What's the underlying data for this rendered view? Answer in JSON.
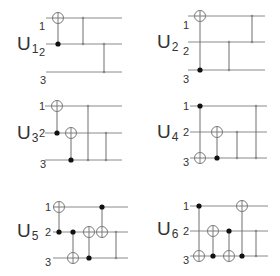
{
  "diagram": {
    "width": 280,
    "height": 276,
    "colors": {
      "wire": "#8a8a8a",
      "control": "#111111",
      "target": "#7a7a7a",
      "text": "#333333"
    },
    "panels": [
      {
        "name": "U1",
        "letter": "U",
        "subscript": "1",
        "label_pos": [
          17,
          50
        ],
        "wire_x": [
          46,
          122
        ],
        "wires_y": [
          18,
          44,
          72
        ],
        "qubit_labels": [
          {
            "text": "1",
            "x": 39,
            "y": 30
          },
          {
            "text": "2",
            "x": 39,
            "y": 56
          },
          {
            "text": "3",
            "x": 40,
            "y": 84
          }
        ],
        "gates": [
          {
            "type": "cnot",
            "x": 58,
            "control": 2,
            "target": 1
          },
          {
            "type": "cz",
            "x": 83,
            "qubits": [
              1,
              2
            ]
          },
          {
            "type": "cz",
            "x": 104,
            "qubits": [
              2,
              3
            ]
          }
        ]
      },
      {
        "name": "U2",
        "letter": "U",
        "subscript": "2",
        "label_pos": [
          157,
          48
        ],
        "wire_x": [
          188,
          265
        ],
        "wires_y": [
          16,
          42,
          70
        ],
        "qubit_labels": [
          {
            "text": "1",
            "x": 183,
            "y": 29
          },
          {
            "text": "2",
            "x": 183,
            "y": 55
          },
          {
            "text": "3",
            "x": 183,
            "y": 83
          }
        ],
        "gates": [
          {
            "type": "cnot",
            "x": 200,
            "control": 3,
            "target": 1
          },
          {
            "type": "cz",
            "x": 229,
            "qubits": [
              2,
              3
            ]
          },
          {
            "type": "cz",
            "x": 252,
            "qubits": [
              1,
              2
            ]
          }
        ]
      },
      {
        "name": "U3",
        "letter": "U",
        "subscript": "3",
        "label_pos": [
          17,
          139
        ],
        "wire_x": [
          45,
          122
        ],
        "wires_y": [
          106,
          133,
          160
        ],
        "qubit_labels": [
          {
            "text": "1",
            "x": 39,
            "y": 110
          },
          {
            "text": "2",
            "x": 39,
            "y": 137
          },
          {
            "text": "3",
            "x": 40,
            "y": 168
          }
        ],
        "gates": [
          {
            "type": "cnot",
            "x": 57,
            "control": 2,
            "target": 1
          },
          {
            "type": "cnot",
            "x": 71,
            "control": 3,
            "target": 2
          },
          {
            "type": "cz",
            "x": 88,
            "qubits": [
              1,
              3
            ]
          },
          {
            "type": "cz",
            "x": 106,
            "qubits": [
              2,
              3
            ]
          }
        ]
      },
      {
        "name": "U4",
        "letter": "U",
        "subscript": "4",
        "label_pos": [
          157,
          138
        ],
        "wire_x": [
          190,
          267
        ],
        "wires_y": [
          106,
          132,
          158
        ],
        "qubit_labels": [
          {
            "text": "1",
            "x": 183,
            "y": 110
          },
          {
            "text": "2",
            "x": 183,
            "y": 136
          },
          {
            "text": "3",
            "x": 183,
            "y": 166
          }
        ],
        "gates": [
          {
            "type": "cnot",
            "x": 200,
            "control": 1,
            "target": 3
          },
          {
            "type": "cnot",
            "x": 217,
            "control": 3,
            "target": 2
          },
          {
            "type": "cz",
            "x": 237,
            "qubits": [
              2,
              3
            ]
          },
          {
            "type": "cz",
            "x": 256,
            "qubits": [
              1,
              3
            ]
          }
        ]
      },
      {
        "name": "U5",
        "letter": "U",
        "subscript": "5",
        "label_pos": [
          17,
          237
        ],
        "wire_x": [
          53,
          128
        ],
        "wires_y": [
          207,
          232,
          258
        ],
        "qubit_labels": [
          {
            "text": "1",
            "x": 45,
            "y": 211
          },
          {
            "text": "2",
            "x": 45,
            "y": 236
          },
          {
            "text": "3",
            "x": 45,
            "y": 266
          }
        ],
        "gates": [
          {
            "type": "cnot",
            "x": 59,
            "control": 2,
            "target": 1
          },
          {
            "type": "cnot",
            "x": 73,
            "control": 2,
            "target": 3
          },
          {
            "type": "cnot",
            "x": 89,
            "control": 3,
            "target": 2
          },
          {
            "type": "cnot",
            "x": 102,
            "control": 1,
            "target": 2
          },
          {
            "type": "cz",
            "x": 116,
            "qubits": [
              2,
              3
            ]
          }
        ]
      },
      {
        "name": "U6",
        "letter": "U",
        "subscript": "6",
        "label_pos": [
          157,
          235
        ],
        "wire_x": [
          190,
          268
        ],
        "wires_y": [
          206,
          231,
          256
        ],
        "qubit_labels": [
          {
            "text": "1",
            "x": 183,
            "y": 210
          },
          {
            "text": "2",
            "x": 183,
            "y": 235
          },
          {
            "text": "3",
            "x": 183,
            "y": 264
          }
        ],
        "gates": [
          {
            "type": "cnot",
            "x": 199,
            "control": 1,
            "target": 3
          },
          {
            "type": "cnot",
            "x": 213,
            "control": 3,
            "target": 2
          },
          {
            "type": "cnot",
            "x": 229,
            "control": 2,
            "target": 3
          },
          {
            "type": "cnot",
            "x": 242,
            "control": 3,
            "target": 1
          },
          {
            "type": "cz",
            "x": 256,
            "qubits": [
              2,
              3
            ]
          }
        ]
      }
    ]
  }
}
